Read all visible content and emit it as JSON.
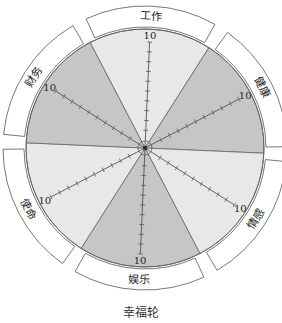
{
  "title": "幸福轮",
  "colors": {
    "light_sector": "#e8e8e8",
    "dark_sector": "#c6c6c6",
    "line": "#666666",
    "band_fill": "#ffffff",
    "band_stroke": "#555555",
    "text": "#222222"
  },
  "chart_data": {
    "type": "wheel",
    "title": "幸福轮",
    "scale_max": 10,
    "ticks_per_spoke": 10,
    "center": [
      145,
      148
    ],
    "radius": 119,
    "segments": [
      {
        "label": "工作",
        "scale_label": "10",
        "shade": "light",
        "spoke_angle": -87.5
      },
      {
        "label": "健康",
        "scale_label": "10",
        "shade": "dark",
        "spoke_angle": -27.5
      },
      {
        "label": "情感",
        "scale_label": "10",
        "shade": "light",
        "spoke_angle": 32.5
      },
      {
        "label": "娱乐",
        "scale_label": "10",
        "shade": "dark",
        "spoke_angle": 92.5
      },
      {
        "label": "使命",
        "scale_label": "10",
        "shade": "light",
        "spoke_angle": 152.5
      },
      {
        "label": "财务",
        "scale_label": "10",
        "shade": "dark",
        "spoke_angle": 212.5
      }
    ]
  }
}
